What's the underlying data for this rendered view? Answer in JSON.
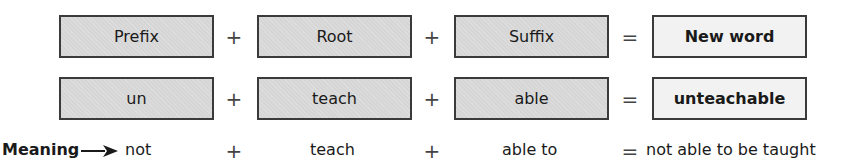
{
  "header_row": {
    "prefix": "Prefix",
    "root": "Root",
    "suffix": "Suffix",
    "result": "New word"
  },
  "example_row": {
    "prefix": "un",
    "root": "teach",
    "suffix": "able",
    "result": "unteachable"
  },
  "meaning_row": {
    "label": "Meaning",
    "arrow_icon": "right-arrow-icon",
    "prefix": "not",
    "root": "teach",
    "suffix": "able to",
    "result": "not able to be taught"
  },
  "operators": {
    "plus": "+",
    "equals": "="
  },
  "colors": {
    "part_fill": "#d6d6d6",
    "result_fill": "#f2f2f2",
    "border": "#3a3a3a"
  }
}
